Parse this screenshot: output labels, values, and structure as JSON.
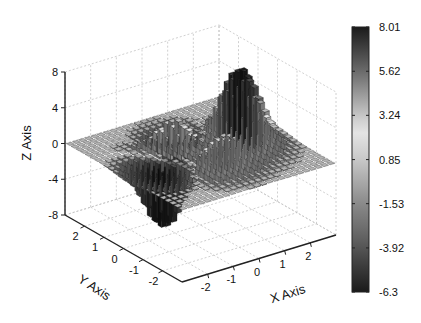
{
  "chart_data": {
    "type": "surface3d",
    "style": "3D bar/column surface, grayscale colormap",
    "title": "",
    "xlabel": "X Axis",
    "ylabel": "Y Axis",
    "zlabel": "Z Axis",
    "xlim": [
      -3,
      3
    ],
    "ylim": [
      -3,
      3
    ],
    "zlim": [
      -8,
      8
    ],
    "x_ticks": [
      "-2",
      "-1",
      "0",
      "1",
      "2"
    ],
    "x_tick_values": [
      -2,
      -1,
      0,
      1,
      2
    ],
    "y_ticks": [
      "2",
      "1",
      "0",
      "-1",
      "-2"
    ],
    "y_tick_values": [
      2,
      1,
      0,
      -1,
      -2
    ],
    "z_ticks": [
      "8",
      "4",
      "0",
      "-4",
      "-8"
    ],
    "z_tick_values": [
      8,
      4,
      0,
      -4,
      -8
    ],
    "grid": true,
    "surface_function": "peaks",
    "surface_description": "Peaks-like surface: main maximum ~8 near back-left region, secondary positive bump ~3, minimum ~-6.3 near front-right; mostly flat ~0 elsewhere",
    "grid_resolution": 25,
    "colorbar": {
      "placement": "right",
      "labels": [
        "8.01",
        "5.62",
        "3.24",
        "0.85",
        "-1.53",
        "-3.92",
        "-6.3"
      ],
      "values": [
        8.01,
        5.62,
        3.24,
        0.85,
        -1.53,
        -3.92,
        -6.3
      ],
      "min": -6.3,
      "max": 8.01,
      "colormap_stops": [
        {
          "value": -6.3,
          "color": "#1a1a1a"
        },
        {
          "value": -3.92,
          "color": "#555555"
        },
        {
          "value": -1.53,
          "color": "#8a8a8a"
        },
        {
          "value": 0.85,
          "color": "#c8c8c8"
        },
        {
          "value": 2.4,
          "color": "#e6e6e6"
        },
        {
          "value": 5.62,
          "color": "#6a6a6a"
        },
        {
          "value": 8.01,
          "color": "#1a1a1a"
        }
      ]
    }
  }
}
